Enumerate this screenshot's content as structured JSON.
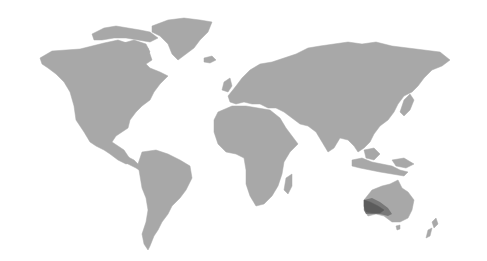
{
  "map": {
    "type": "world-choropleth",
    "base_color": "#a8a8a8",
    "highlight_color": "#5c5c5c",
    "highlight_secondary_color": "#787878",
    "background_color": "#ffffff",
    "highlighted_region": "south-western-australia",
    "regions": [
      "north-america",
      "greenland",
      "south-america",
      "europe",
      "africa",
      "asia",
      "indonesia",
      "australia",
      "new-zealand",
      "japan",
      "uk",
      "iceland",
      "madagascar",
      "arctic-islands"
    ]
  }
}
